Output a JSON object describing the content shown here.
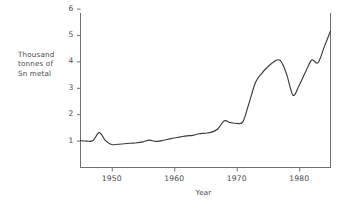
{
  "chart_data": {
    "type": "line",
    "title": "",
    "subtitle": "",
    "xlabel": "Year",
    "ylabel": "Thousand tonnes of Sn metal",
    "ylabel_lines": [
      "Thousand",
      "tonnes of",
      "Sn metal"
    ],
    "xlim": [
      1945,
      1985
    ],
    "ylim": [
      0,
      6
    ],
    "y_ticks": [
      1,
      2,
      3,
      4,
      5,
      6
    ],
    "y_tick_labels": [
      "1",
      "2",
      "3",
      "4",
      "5",
      "6"
    ],
    "x_ticks": [
      1950,
      1960,
      1970,
      1980
    ],
    "x_tick_labels": [
      "1950",
      "1960",
      "1970",
      "1980"
    ],
    "grid": false,
    "legend": "none",
    "series": [
      {
        "name": "Sn metal production",
        "color": "#3a3a3a",
        "x": [
          1945,
          1946,
          1947,
          1948,
          1949,
          1950,
          1951,
          1952,
          1953,
          1954,
          1955,
          1956,
          1957,
          1958,
          1959,
          1960,
          1961,
          1962,
          1963,
          1964,
          1965,
          1966,
          1967,
          1968,
          1969,
          1970,
          1971,
          1972,
          1973,
          1974,
          1975,
          1976,
          1977,
          1978,
          1979,
          1980,
          1981,
          1982,
          1983,
          1984,
          1985
        ],
        "values": [
          1.0,
          0.98,
          1.0,
          1.3,
          1.0,
          0.85,
          0.86,
          0.88,
          0.9,
          0.92,
          0.95,
          1.02,
          0.97,
          1.0,
          1.05,
          1.1,
          1.14,
          1.18,
          1.2,
          1.26,
          1.28,
          1.32,
          1.45,
          1.75,
          1.68,
          1.65,
          1.72,
          2.45,
          3.2,
          3.55,
          3.8,
          4.0,
          4.03,
          3.5,
          2.72,
          3.1,
          3.6,
          4.05,
          3.95,
          4.55,
          5.15
        ]
      }
    ]
  },
  "axis": {
    "y_label_line1": "Thousand",
    "y_label_line2": "tonnes of",
    "y_label_line3": "Sn metal",
    "x_title": "Year"
  },
  "colors": {
    "line": "#3a3a3a",
    "axis": "#6f6f6f",
    "text": "#4a4a4a",
    "background": "#ffffff"
  }
}
